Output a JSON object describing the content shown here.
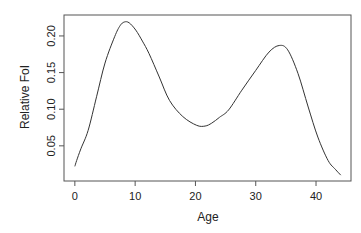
{
  "chart_data": {
    "type": "line",
    "title": "",
    "xlabel": "Age",
    "ylabel": "Relative FoI",
    "xlim": [
      -1.8,
      45.8
    ],
    "ylim": [
      0.002,
      0.2286
    ],
    "x_ticks": [
      0,
      10,
      20,
      30,
      40
    ],
    "x_tick_labels": [
      "0",
      "10",
      "20",
      "30",
      "40"
    ],
    "y_ticks": [
      0.05,
      0.1,
      0.15,
      0.2
    ],
    "y_tick_labels": [
      "0.05",
      "0.10",
      "0.15",
      "0.20"
    ],
    "grid": false,
    "legend": null,
    "series": [
      {
        "name": "Relative FoI",
        "color": "#333333",
        "x": [
          0.0,
          0.3,
          1.0,
          2.2,
          3.6,
          5.0,
          6.6,
          7.5,
          8.2,
          9.0,
          10.1,
          11.2,
          12.3,
          14.0,
          15.7,
          17.9,
          20.2,
          21.6,
          22.7,
          24.0,
          25.5,
          27.7,
          30.0,
          32.2,
          33.9,
          35.3,
          37.0,
          38.7,
          40.3,
          42.0,
          43.2,
          44.1
        ],
        "y": [
          0.022,
          0.03,
          0.046,
          0.071,
          0.117,
          0.163,
          0.199,
          0.214,
          0.219,
          0.218,
          0.208,
          0.193,
          0.176,
          0.144,
          0.112,
          0.09,
          0.078,
          0.077,
          0.081,
          0.089,
          0.099,
          0.126,
          0.153,
          0.178,
          0.187,
          0.181,
          0.149,
          0.103,
          0.062,
          0.03,
          0.018,
          0.01
        ]
      }
    ]
  },
  "plot_box": {
    "left": 64,
    "top": 15,
    "right": 351,
    "bottom": 181
  },
  "labels": {
    "xlabel": "Age",
    "ylabel": "Relative FoI"
  }
}
